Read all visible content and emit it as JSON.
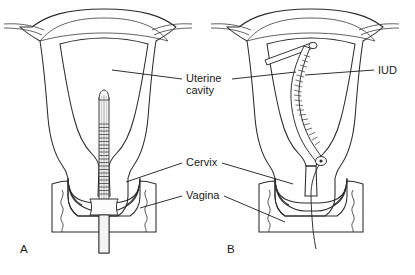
{
  "figure": {
    "background_color": "#ffffff",
    "labels": {
      "uterine_cavity_line1": "Uterine",
      "uterine_cavity_line2": "cavity",
      "cervix": "Cervix",
      "vagina": "Vagina",
      "iud": "IUD"
    },
    "panels": [
      {
        "id": "A",
        "label": "A",
        "caption": "A"
      },
      {
        "id": "B",
        "label": "B",
        "caption": "B"
      }
    ],
    "colors": {
      "myometrium": "#a9a9a9",
      "myometrium_dark": "#8f8f8f",
      "cavity_light": "#fbfbfb",
      "cavity_mid": "#e3e3e3",
      "vagina_wall": "#a9a9a9",
      "outline": "#2b2b2b",
      "device_white": "#fdfdfd",
      "text": "#1a1a1a"
    },
    "parts": {
      "inserter_tube": "inserter-tube",
      "inserter_flange": "inserter-flange",
      "iud_device": "iud-device",
      "iud_string": "iud-string",
      "fallopian_tube": "fallopian-tube",
      "fundus": "uterine-fundus"
    }
  }
}
